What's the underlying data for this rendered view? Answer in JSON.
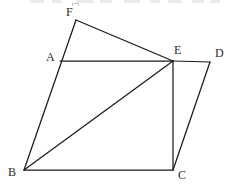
{
  "figure": {
    "width": 232,
    "height": 185,
    "background_color": "#ffffff",
    "stroke_color": "#1a1a1a",
    "label_color": "#2b2b2b",
    "stroke_width": 1.25,
    "vertices": [
      {
        "id": "F",
        "label": "F",
        "x": 76,
        "y": 20,
        "label_x": 66,
        "label_y": 6
      },
      {
        "id": "A",
        "label": "A",
        "x": 60,
        "y": 61,
        "label_x": 46,
        "label_y": 51
      },
      {
        "id": "E",
        "label": "E",
        "x": 173,
        "y": 61,
        "label_x": 174,
        "label_y": 44
      },
      {
        "id": "D",
        "label": "D",
        "x": 210,
        "y": 62,
        "label_x": 215,
        "label_y": 47
      },
      {
        "id": "B",
        "label": "B",
        "x": 24,
        "y": 170,
        "label_x": 8,
        "label_y": 166
      },
      {
        "id": "C",
        "label": "C",
        "x": 173,
        "y": 170,
        "label_x": 178,
        "label_y": 169
      }
    ],
    "edges": [
      {
        "name": "segment-F-E",
        "from": "F",
        "to": "E"
      },
      {
        "name": "segment-F-B",
        "from": "F",
        "to": "B"
      },
      {
        "name": "segment-A-E",
        "from": "A",
        "to": "E"
      },
      {
        "name": "segment-E-D",
        "from": "E",
        "to": "D"
      },
      {
        "name": "segment-E-C",
        "from": "E",
        "to": "C"
      },
      {
        "name": "segment-B-E",
        "from": "B",
        "to": "E"
      },
      {
        "name": "segment-D-C",
        "from": "D",
        "to": "C"
      },
      {
        "name": "segment-B-C",
        "from": "B",
        "to": "C"
      }
    ],
    "notes": {
      "collinear": "F, A, B lie on one straight line",
      "quadrilateral": "A-E-C-B forms the main quadrilateral",
      "diagonal": "B-E is the diagonal of quadrilateral A-E-C-B"
    }
  },
  "top_bleed": {
    "description": "partial cut-off text row from the page above",
    "marks": [
      {
        "x": 30,
        "width": 14
      },
      {
        "x": 52,
        "width": 10
      },
      {
        "x": 76,
        "width": 18
      },
      {
        "x": 100,
        "width": 12
      },
      {
        "x": 124,
        "width": 16
      },
      {
        "x": 150,
        "width": 10
      },
      {
        "x": 168,
        "width": 14
      },
      {
        "x": 192,
        "width": 12
      },
      {
        "x": 210,
        "width": 10
      }
    ],
    "box": {
      "x": 72,
      "label": "glyph-fragment"
    }
  }
}
